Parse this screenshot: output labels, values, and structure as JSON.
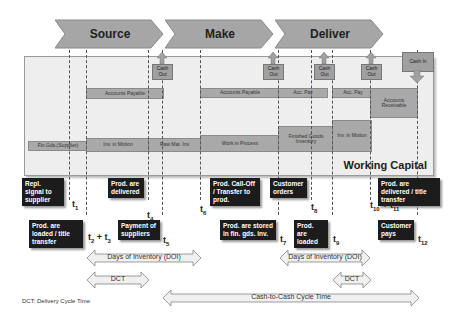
{
  "phases": [
    {
      "label": "Source"
    },
    {
      "label": "Make"
    },
    {
      "label": "Deliver"
    }
  ],
  "working_capital": {
    "label": "Working Capital"
  },
  "payables": [
    {
      "label": "Accounts Payable"
    },
    {
      "label": "Accounts Payable"
    },
    {
      "label": "Acc. Pay"
    },
    {
      "label": "Acc. Pay"
    }
  ],
  "receivables": {
    "label": "Accounts Receivable"
  },
  "inventory": [
    {
      "label": "Fin.Gds.(Supplier)"
    },
    {
      "label": "Inv. in Motion"
    },
    {
      "label": "Raw Mat. Inv."
    },
    {
      "label": "Work in Process"
    },
    {
      "label": "Finished Goods Inventory"
    },
    {
      "label": "Inv. in Motion"
    }
  ],
  "cash_out": [
    {
      "label": "Cash Out"
    },
    {
      "label": "Cash Out"
    },
    {
      "label": "Cash Out"
    },
    {
      "label": "Cash Out"
    }
  ],
  "cash_in": {
    "label": "Cash In"
  },
  "events": [
    {
      "label": "Repl. signal to supplier",
      "time": "t1"
    },
    {
      "label": "Prod. are loaded / title transfer",
      "time": "t2 + t3"
    },
    {
      "label": "Prod. are delivered",
      "time": "t4"
    },
    {
      "label": "Payment of suppliers",
      "time": "t5"
    },
    {
      "label": "Prod. Call-Off / Transfer to prod.",
      "time": "t6"
    },
    {
      "label": "Prod. are stored in fin. gds. inv.",
      "time": "t7"
    },
    {
      "label": "Customer orders",
      "time": "t8"
    },
    {
      "label": "Prod. are loaded",
      "time": "t9"
    },
    {
      "label": "Prod. are delivered / title transfer",
      "time": "t10 + t11"
    },
    {
      "label": "Customer pays",
      "time": "t12"
    }
  ],
  "spans": [
    {
      "label": "Days of Inventory (DOI)"
    },
    {
      "label": "DCT"
    },
    {
      "label": "Days of Inventory (DOI)"
    },
    {
      "label": "DCT"
    },
    {
      "label": "Cash-to-Cash Cycle Time"
    }
  ],
  "footnote": "DCT: Delivery Cycle Time",
  "colors": {
    "chevron": "#a6a6a6",
    "bar": "#a9a9a9",
    "event_box": "#1c1c1c",
    "panel": "#eeeeee"
  }
}
